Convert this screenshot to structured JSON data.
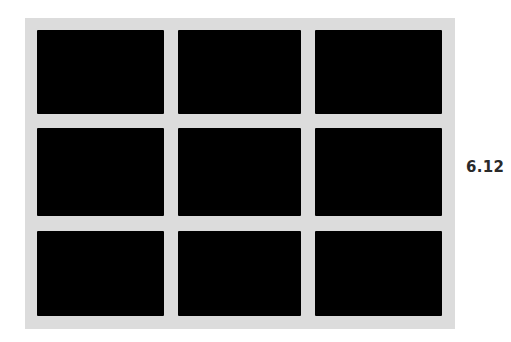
{
  "figure": {
    "label": "6.12",
    "frame_color": "#dcdcdc",
    "cell_color": "#000000",
    "grid": {
      "rows": 3,
      "cols": 3,
      "cells": [
        {
          "row": 0,
          "col": 0
        },
        {
          "row": 0,
          "col": 1
        },
        {
          "row": 0,
          "col": 2
        },
        {
          "row": 1,
          "col": 0
        },
        {
          "row": 1,
          "col": 1
        },
        {
          "row": 1,
          "col": 2
        },
        {
          "row": 2,
          "col": 0
        },
        {
          "row": 2,
          "col": 1
        },
        {
          "row": 2,
          "col": 2
        }
      ]
    }
  }
}
